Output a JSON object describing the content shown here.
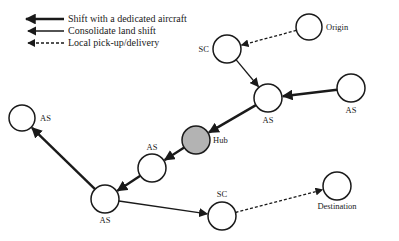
{
  "legend": {
    "items": [
      {
        "id": "dedicated",
        "label": "Shift with a dedicated aircraft",
        "style": "thick"
      },
      {
        "id": "consolidate",
        "label": "Consolidate land shift",
        "style": "thin"
      },
      {
        "id": "local",
        "label": "Local pick-up/delivery",
        "style": "dashed"
      }
    ]
  },
  "colors": {
    "stroke": "#1a1a1a",
    "node_fill": "#ffffff",
    "hub_fill": "#b3b3b3",
    "background": "#ffffff"
  },
  "nodes": [
    {
      "id": "origin",
      "label": "Origin",
      "type": "endpoint",
      "cx": 309,
      "cy": 27,
      "r": 13,
      "label_x": 326,
      "label_y": 30,
      "anchor": "start"
    },
    {
      "id": "sc_top",
      "label": "SC",
      "type": "sc",
      "cx": 227,
      "cy": 49,
      "r": 14,
      "label_x": 209,
      "label_y": 52,
      "anchor": "end"
    },
    {
      "id": "as_center",
      "label": "AS",
      "type": "as",
      "cx": 268,
      "cy": 98,
      "r": 14,
      "label_x": 268,
      "label_y": 123,
      "anchor": "middle"
    },
    {
      "id": "as_right",
      "label": "AS",
      "type": "as",
      "cx": 351,
      "cy": 88,
      "r": 14,
      "label_x": 351,
      "label_y": 113,
      "anchor": "middle"
    },
    {
      "id": "as_left",
      "label": "AS",
      "type": "as",
      "cx": 22,
      "cy": 118,
      "r": 13,
      "label_x": 40,
      "label_y": 121,
      "anchor": "start"
    },
    {
      "id": "hub",
      "label": "Hub",
      "type": "hub",
      "cx": 196,
      "cy": 140,
      "r": 14,
      "label_x": 213,
      "label_y": 143,
      "anchor": "start"
    },
    {
      "id": "as_mid",
      "label": "AS",
      "type": "as",
      "cx": 152,
      "cy": 168,
      "r": 14,
      "label_x": 152,
      "label_y": 150,
      "anchor": "middle"
    },
    {
      "id": "as_bottom",
      "label": "AS",
      "type": "as",
      "cx": 105,
      "cy": 199,
      "r": 14,
      "label_x": 105,
      "label_y": 223,
      "anchor": "middle"
    },
    {
      "id": "sc_bottom",
      "label": "SC",
      "type": "sc",
      "cx": 222,
      "cy": 216,
      "r": 14,
      "label_x": 222,
      "label_y": 197,
      "anchor": "middle"
    },
    {
      "id": "destination",
      "label": "Destination",
      "type": "endpoint",
      "cx": 337,
      "cy": 186,
      "r": 14,
      "label_x": 337,
      "label_y": 209,
      "anchor": "middle"
    }
  ],
  "edges": [
    {
      "from": "origin",
      "to": "sc_top",
      "style": "dashed"
    },
    {
      "from": "sc_top",
      "to": "as_center",
      "style": "thin"
    },
    {
      "from": "as_right",
      "to": "as_center",
      "style": "thick"
    },
    {
      "from": "as_center",
      "to": "hub",
      "style": "thick"
    },
    {
      "from": "hub",
      "to": "as_mid",
      "style": "thick"
    },
    {
      "from": "as_mid",
      "to": "as_bottom",
      "style": "thick"
    },
    {
      "from": "as_bottom",
      "to": "as_left",
      "style": "thick"
    },
    {
      "from": "as_bottom",
      "to": "sc_bottom",
      "style": "thin"
    },
    {
      "from": "sc_bottom",
      "to": "destination",
      "style": "dashed"
    }
  ]
}
